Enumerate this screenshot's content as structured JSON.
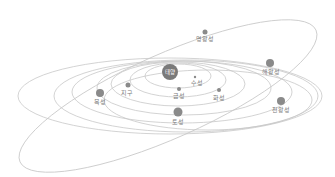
{
  "diagram": {
    "title": "",
    "colors": {
      "orbit": "#c8c8c8",
      "planet": "#8a8a8a",
      "sun": "#7a7a7a",
      "label": "#7a7a7a",
      "background": "#ffffff"
    },
    "sun": {
      "label": "태양"
    },
    "planets": [
      {
        "key": "mercury",
        "label": "수성"
      },
      {
        "key": "venus",
        "label": "금성"
      },
      {
        "key": "earth",
        "label": "지구"
      },
      {
        "key": "mars",
        "label": "화성"
      },
      {
        "key": "jupiter",
        "label": "목성"
      },
      {
        "key": "saturn",
        "label": "토성"
      },
      {
        "key": "uranus",
        "label": "천왕성"
      },
      {
        "key": "neptune",
        "label": "해왕성"
      },
      {
        "key": "pluto",
        "label": "명왕성"
      }
    ]
  }
}
